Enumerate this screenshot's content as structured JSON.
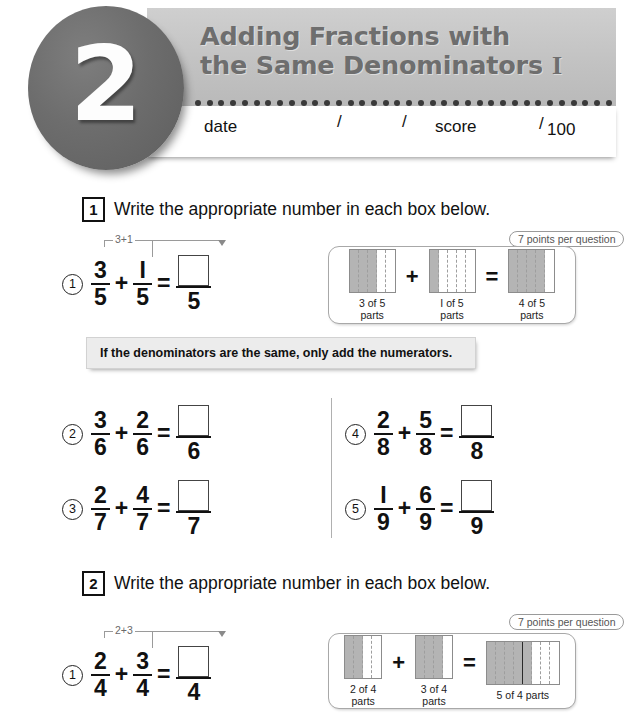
{
  "header": {
    "lesson_number": "2",
    "title_line1": "Adding Fractions with",
    "title_line2": "the Same Denominators",
    "title_numeral": "I",
    "date_label": "date",
    "slash1": "/",
    "slash2": "/",
    "score_label": "score",
    "score_slash": "/",
    "score_total": "100"
  },
  "sections": [
    {
      "number": "1",
      "instruction": "Write the appropriate number in each box below.",
      "badge": "7 points per question",
      "hint": "If the denominators are the same, only add the numerators.",
      "annotation": "3+1",
      "problems": [
        {
          "id": "1",
          "a_num": "3",
          "a_den": "5",
          "op": "+",
          "b_num": "I",
          "b_den": "5",
          "eq": "=",
          "ans_den": "5"
        },
        {
          "id": "2",
          "a_num": "3",
          "a_den": "6",
          "op": "+",
          "b_num": "2",
          "b_den": "6",
          "eq": "=",
          "ans_den": "6"
        },
        {
          "id": "3",
          "a_num": "2",
          "a_den": "7",
          "op": "+",
          "b_num": "4",
          "b_den": "7",
          "eq": "=",
          "ans_den": "7"
        },
        {
          "id": "4",
          "a_num": "2",
          "a_den": "8",
          "op": "+",
          "b_num": "5",
          "b_den": "8",
          "eq": "=",
          "ans_den": "8"
        },
        {
          "id": "5",
          "a_num": "I",
          "a_den": "9",
          "op": "+",
          "b_num": "6",
          "b_den": "9",
          "eq": "=",
          "ans_den": "9"
        }
      ],
      "diagram": {
        "op": "+",
        "eq": "=",
        "bars": [
          {
            "cells": 5,
            "filled": 3,
            "caption": "3 of 5\nparts",
            "split_after": 0
          },
          {
            "cells": 5,
            "filled": 1,
            "caption": "I of 5\nparts",
            "split_after": 0
          },
          {
            "cells": 5,
            "filled": 4,
            "caption": "4 of 5\nparts",
            "split_after": 0
          }
        ]
      }
    },
    {
      "number": "2",
      "instruction": "Write the appropriate number in each box below.",
      "badge": "7 points per question",
      "annotation": "2+3",
      "problems": [
        {
          "id": "1",
          "a_num": "2",
          "a_den": "4",
          "op": "+",
          "b_num": "3",
          "b_den": "4",
          "eq": "=",
          "ans_den": "4"
        }
      ],
      "diagram": {
        "op": "+",
        "eq": "=",
        "bars": [
          {
            "cells": 4,
            "filled": 2,
            "caption": "2 of 4\nparts",
            "split_after": 0
          },
          {
            "cells": 4,
            "filled": 3,
            "caption": "3 of 4\nparts",
            "split_after": 0
          },
          {
            "cells": 8,
            "filled": 5,
            "caption": "5 of 4 parts",
            "split_after": 4
          }
        ]
      }
    }
  ]
}
